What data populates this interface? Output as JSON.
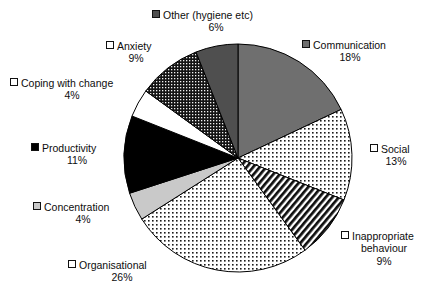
{
  "chart_data": {
    "type": "pie",
    "title": "",
    "categories": [
      "Communication",
      "Social",
      "Inappropriate behaviour",
      "Organisational",
      "Concentration",
      "Productivity",
      "Coping with change",
      "Anxiety",
      "Other (hygiene etc)"
    ],
    "values": [
      18,
      13,
      9,
      26,
      4,
      11,
      4,
      9,
      6
    ],
    "value_unit": "%",
    "legend_position": "around-slices",
    "grid": false,
    "start_angle_deg": 0,
    "direction": "clockwise",
    "slices": [
      {
        "label": "Communication",
        "value": 18,
        "percent_text": "18%",
        "fill": "solid-gray",
        "color": "#6f6f6f",
        "swatch": "sw-solid-gray"
      },
      {
        "label": "Social",
        "value": 13,
        "percent_text": "13%",
        "fill": "fine-dots",
        "color": "#ffffff",
        "swatch": "sw-dots"
      },
      {
        "label": "Inappropriate behaviour",
        "value": 9,
        "percent_text": "9%",
        "fill": "diagonal-stripes",
        "color": "#ffffff",
        "swatch": "sw-diag"
      },
      {
        "label": "Organisational",
        "value": 26,
        "percent_text": "26%",
        "fill": "fine-dots",
        "color": "#ffffff",
        "swatch": "sw-dots"
      },
      {
        "label": "Concentration",
        "value": 4,
        "percent_text": "4%",
        "fill": "light-gray",
        "color": "#c9c9c9",
        "swatch": "sw-ltgray"
      },
      {
        "label": "Productivity",
        "value": 11,
        "percent_text": "11%",
        "fill": "solid-black",
        "color": "#000000",
        "swatch": "sw-black"
      },
      {
        "label": "Coping with change",
        "value": 4,
        "percent_text": "4%",
        "fill": "white",
        "color": "#ffffff",
        "swatch": "sw-white"
      },
      {
        "label": "Anxiety",
        "value": 9,
        "percent_text": "9%",
        "fill": "dense-grid",
        "color": "#2a2a2a",
        "swatch": "sw-grid"
      },
      {
        "label": "Other (hygiene etc)",
        "value": 6,
        "percent_text": "6%",
        "fill": "dark-gray",
        "color": "#4f4f4f",
        "swatch": "sw-dkgray"
      }
    ]
  },
  "labels": {
    "other": {
      "name": "Other (hygiene etc)",
      "pct": "6%"
    },
    "comm": {
      "name": "Communication",
      "pct": "18%"
    },
    "social": {
      "name": "Social",
      "pct": "13%"
    },
    "inapp": {
      "name": "Inappropriate",
      "name2": "behaviour",
      "pct": "9%"
    },
    "org": {
      "name": "Organisational",
      "pct": "26%"
    },
    "conc": {
      "name": "Concentration",
      "pct": "4%"
    },
    "prod": {
      "name": "Productivity",
      "pct": "11%"
    },
    "cope": {
      "name": "Coping with change",
      "pct": "4%"
    },
    "anx": {
      "name": "Anxiety",
      "pct": "9%"
    }
  }
}
